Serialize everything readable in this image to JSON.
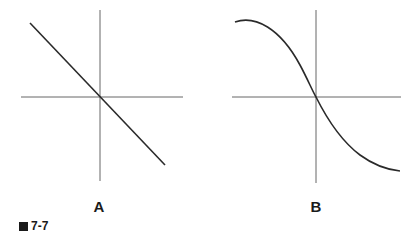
{
  "figure": {
    "caption_number": "7-7",
    "caption_marker": "black-square",
    "panels": [
      {
        "label": "A",
        "curve": "straight line with negative slope through origin"
      },
      {
        "label": "B",
        "curve": "sigmoid-like decreasing curve through origin"
      }
    ]
  },
  "colors": {
    "axis": "#555555",
    "curve": "#2a2a2a",
    "text": "#1a1a1a"
  }
}
